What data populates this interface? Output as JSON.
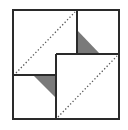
{
  "diagram": {
    "title": "",
    "colors": {
      "background": "#ffffff",
      "outline": "#2a2a2a",
      "fill_triangle": "#7a7a7a",
      "dotted": "#555555"
    },
    "outer_square": {
      "x": 13,
      "y": 10,
      "w": 106,
      "h": 109
    },
    "lines": [
      {
        "name": "top-block-vertical-divider",
        "x1": 77,
        "y1": 10,
        "x2": 77,
        "y2": 54
      },
      {
        "name": "inner-square-top-edge",
        "x1": 56,
        "y1": 54,
        "x2": 119,
        "y2": 54
      },
      {
        "name": "left-horizontal-divider",
        "x1": 13,
        "y1": 75,
        "x2": 56,
        "y2": 75
      },
      {
        "name": "inner-square-left-edge",
        "x1": 56,
        "y1": 54,
        "x2": 56,
        "y2": 119
      }
    ],
    "triangles": [
      {
        "name": "upper-gray-triangle",
        "points": "77,30 77,54 100,54"
      },
      {
        "name": "lower-gray-triangle",
        "points": "33,75 56,75 56,98"
      }
    ],
    "dotted_lines": [
      {
        "name": "upper-left-diagonal-fold",
        "x1": 16,
        "y1": 73,
        "x2": 75,
        "y2": 12
      },
      {
        "name": "lower-right-diagonal-fold",
        "x1": 58,
        "y1": 117,
        "x2": 117,
        "y2": 56
      }
    ]
  }
}
